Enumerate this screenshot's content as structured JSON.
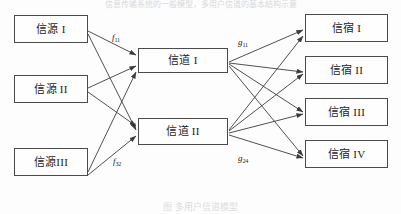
{
  "figure": {
    "title_fragment_top": "信息传输系统的一般模型，多用户信道的基本结构示意",
    "caption_fragment_bottom": "图  多用户信道模型"
  },
  "columns": {
    "sources": {
      "name": "信源",
      "nodes": [
        {
          "label": "信源 I",
          "x": 14,
          "y": 15,
          "w": 74,
          "h": 28
        },
        {
          "label": "信源 II",
          "x": 14,
          "y": 75,
          "w": 74,
          "h": 28
        },
        {
          "label": "信源III",
          "x": 14,
          "y": 148,
          "w": 74,
          "h": 28
        }
      ]
    },
    "channels": {
      "name": "信道",
      "nodes": [
        {
          "label": "信道 I",
          "x": 138,
          "y": 48,
          "w": 90,
          "h": 25
        },
        {
          "label": "信道 II",
          "x": 138,
          "y": 118,
          "w": 90,
          "h": 27
        }
      ]
    },
    "sinks": {
      "name": "信宿",
      "nodes": [
        {
          "label": "信宿 I",
          "x": 305,
          "y": 14,
          "w": 83,
          "h": 28
        },
        {
          "label": "信宿 II",
          "x": 305,
          "y": 56,
          "w": 83,
          "h": 28
        },
        {
          "label": "信宿 III",
          "x": 305,
          "y": 98,
          "w": 83,
          "h": 28
        },
        {
          "label": "信宿 IV",
          "x": 305,
          "y": 140,
          "w": 83,
          "h": 28
        }
      ]
    }
  },
  "edge_labels": [
    {
      "id": "f11",
      "base": "f",
      "sub": "11",
      "x": 112,
      "y": 33
    },
    {
      "id": "f32",
      "base": "f",
      "sub": "32",
      "x": 113,
      "y": 157
    },
    {
      "id": "g11",
      "base": "g",
      "sub": "11",
      "x": 238,
      "y": 38
    },
    {
      "id": "g24",
      "base": "g",
      "sub": "24",
      "x": 238,
      "y": 154
    }
  ],
  "edges": {
    "source_to_channel": [
      {
        "from": "信源 I",
        "to": "信道 I"
      },
      {
        "from": "信源 I",
        "to": "信道 II"
      },
      {
        "from": "信源 II",
        "to": "信道 I"
      },
      {
        "from": "信源 II",
        "to": "信道 II"
      },
      {
        "from": "信源III",
        "to": "信道 I"
      },
      {
        "from": "信源III",
        "to": "信道 II"
      }
    ],
    "channel_to_sink": [
      {
        "from": "信道 I",
        "to": "信宿 I"
      },
      {
        "from": "信道 I",
        "to": "信宿 II"
      },
      {
        "from": "信道 I",
        "to": "信宿 III"
      },
      {
        "from": "信道 I",
        "to": "信宿 IV"
      },
      {
        "from": "信道 II",
        "to": "信宿 I"
      },
      {
        "from": "信道 II",
        "to": "信宿 II"
      },
      {
        "from": "信道 II",
        "to": "信宿 III"
      },
      {
        "from": "信道 II",
        "to": "信宿 IV"
      }
    ]
  },
  "colors": {
    "line": "#3c3c3c",
    "box_border": "#4a4a4a",
    "box_fill": "#fefefe",
    "text": "#1c1c1c",
    "page_bg": "#fdfdfd"
  }
}
